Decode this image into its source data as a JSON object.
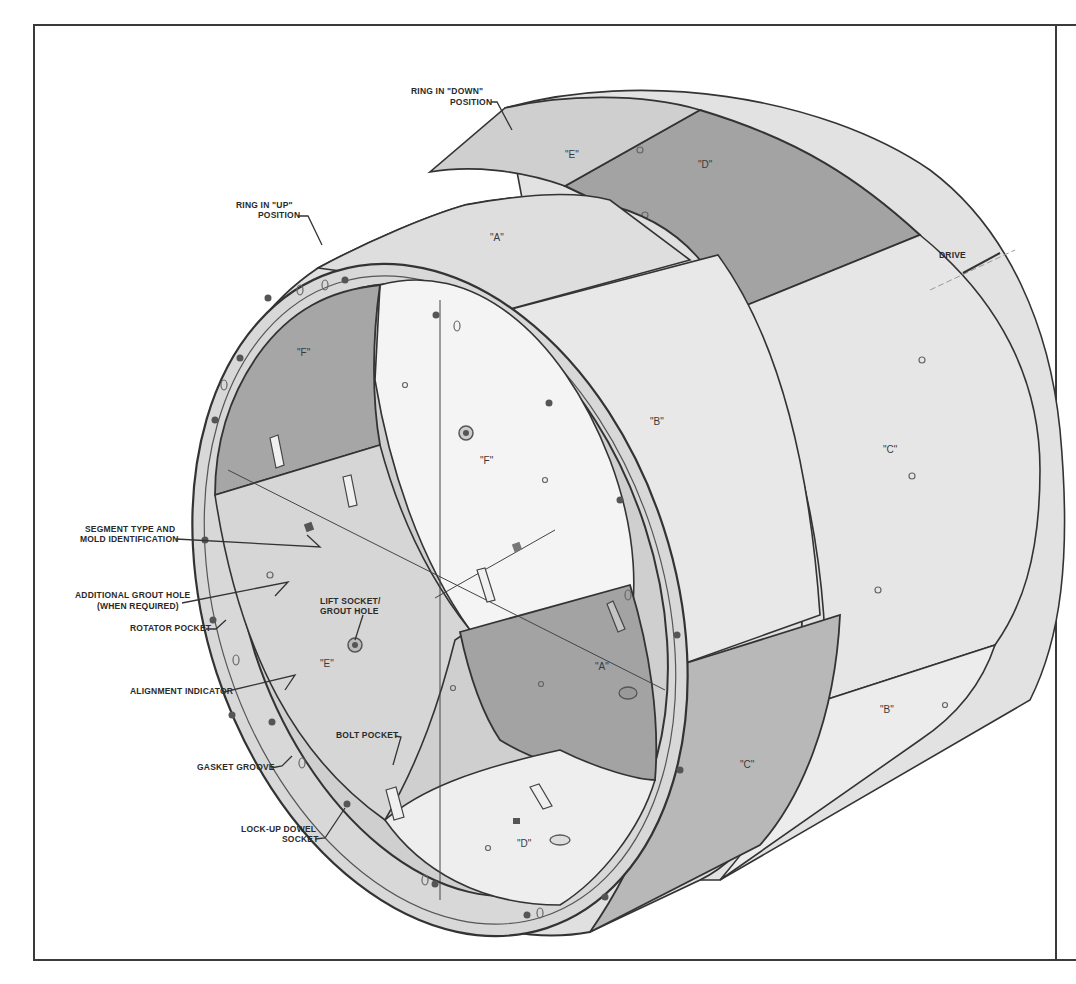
{
  "figure": {
    "type": "isometric tunnel lining ring drawing",
    "colors": {
      "background": "#ffffff",
      "frame": "#3a3a3a",
      "segment_light": "#e4e4e4",
      "segment_medium": "#b9b9b9",
      "segment_dark": "#9a9a9a",
      "interior_bright": "#f3f3f3",
      "line": "#333333"
    }
  },
  "callouts": {
    "ring_down": [
      "RING IN \"DOWN\"",
      "POSITION"
    ],
    "ring_up": [
      "RING IN \"UP\"",
      "POSITION"
    ],
    "drive": "DRIVE",
    "segment_type": [
      "SEGMENT TYPE AND",
      "MOLD IDENTIFICATION"
    ],
    "additional_grout": [
      "ADDITIONAL GROUT HOLE",
      "(WHEN REQUIRED)"
    ],
    "rotator_pocket": "ROTATOR POCKET",
    "lift_socket": [
      "LIFT SOCKET/",
      "GROUT HOLE"
    ],
    "alignment_indicator": "ALIGNMENT INDICATOR",
    "bolt_pocket": "BOLT POCKET",
    "gasket_groove": "GASKET GROOVE",
    "lock_up_dowel": [
      "LOCK-UP DOWEL",
      "SOCKET"
    ]
  },
  "segments": {
    "outer_ring_down": {
      "E": "\"E\"",
      "D": "\"D\"",
      "C": "\"C\"",
      "B": "\"B\""
    },
    "outer_ring_up": {
      "A": "\"A\"",
      "B": "\"B\"",
      "C": "\"C\""
    },
    "interior": {
      "F_dark": "\"F\"",
      "F_bright": "\"F\"",
      "E": "\"E\"",
      "A": "\"A\"",
      "D": "\"D\""
    }
  }
}
